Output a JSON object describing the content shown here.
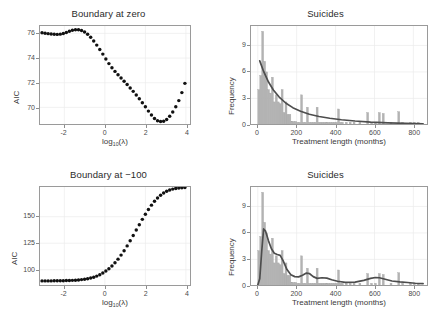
{
  "figure": {
    "kind": "2x2 panel figure",
    "background": "#ffffff",
    "colors": {
      "point": "#111111",
      "bar_fill": "#b3b3b3",
      "bar_stroke": "#a6a6a6",
      "curve": "#4d4d4d",
      "axis": "#9a9a9a",
      "grid": "#ebebeb",
      "text": "#3a3a3a"
    }
  },
  "panels": {
    "top_left": {
      "title": "Boundary at zero",
      "xlabel_main": "log",
      "xlabel_sub": "10",
      "xlabel_tail": "(λ)",
      "ylabel": "AIC"
    },
    "top_right": {
      "title": "Suicides",
      "xlabel": "Treatment length (months)",
      "ylabel": "Frequency"
    },
    "bottom_left": {
      "title": "Boundary at −100",
      "xlabel_main": "log",
      "xlabel_sub": "10",
      "xlabel_tail": "(λ)",
      "ylabel": "AIC"
    },
    "bottom_right": {
      "title": "Suicides",
      "xlabel": "Treatment length (months)",
      "ylabel": "Frequency"
    }
  },
  "chart_data": [
    {
      "id": "top_left",
      "type": "scatter",
      "title": "Boundary at zero",
      "xlabel": "log10(lambda)",
      "ylabel": "AIC",
      "xlim": [
        -3.2,
        4.2
      ],
      "ylim": [
        68.6,
        76.6
      ],
      "xticks": [
        -2,
        0,
        2,
        4
      ],
      "xticklabels": [
        "-2",
        "0",
        "2",
        "4"
      ],
      "yticks": [
        70,
        72,
        74,
        76
      ],
      "yticklabels": [
        "70",
        "72",
        "74",
        "76"
      ],
      "grid": true,
      "legend": "none",
      "x": [
        -3.1,
        -2.95,
        -2.8,
        -2.65,
        -2.5,
        -2.35,
        -2.2,
        -2.05,
        -1.9,
        -1.75,
        -1.6,
        -1.45,
        -1.3,
        -1.15,
        -1.0,
        -0.85,
        -0.7,
        -0.55,
        -0.4,
        -0.25,
        -0.1,
        0.05,
        0.2,
        0.35,
        0.5,
        0.65,
        0.8,
        0.95,
        1.1,
        1.25,
        1.4,
        1.55,
        1.7,
        1.85,
        2.0,
        2.15,
        2.3,
        2.45,
        2.6,
        2.75,
        2.9,
        3.05,
        3.2,
        3.35,
        3.5,
        3.65,
        3.8,
        3.95
      ],
      "y": [
        76.05,
        76.02,
        75.98,
        75.95,
        75.93,
        75.92,
        75.94,
        75.99,
        76.08,
        76.18,
        76.26,
        76.3,
        76.3,
        76.24,
        76.12,
        75.93,
        75.68,
        75.38,
        75.05,
        74.7,
        74.32,
        73.92,
        73.55,
        73.22,
        72.92,
        72.64,
        72.38,
        72.12,
        71.85,
        71.58,
        71.3,
        71.0,
        70.7,
        70.38,
        70.05,
        69.7,
        69.38,
        69.1,
        68.92,
        68.85,
        68.88,
        69.02,
        69.28,
        69.62,
        70.05,
        70.55,
        71.2,
        71.95
      ]
    },
    {
      "id": "top_right",
      "type": "bar",
      "title": "Suicides",
      "xlabel": "Treatment length (months)",
      "ylabel": "Frequency",
      "xlim": [
        -35,
        870
      ],
      "ylim": [
        0,
        11.2
      ],
      "xticks": [
        0,
        200,
        400,
        600,
        800
      ],
      "xticklabels": [
        "0",
        "200",
        "400",
        "600",
        "800"
      ],
      "yticks": [
        0,
        3,
        6,
        9
      ],
      "yticklabels": [
        "0",
        "3",
        "6",
        "9"
      ],
      "grid": true,
      "legend": "none",
      "bin_width": 10,
      "bin_centers": [
        5,
        15,
        25,
        35,
        45,
        55,
        65,
        75,
        85,
        95,
        105,
        115,
        125,
        135,
        145,
        155,
        165,
        175,
        185,
        195,
        205,
        215,
        225,
        235,
        245,
        255,
        265,
        275,
        285,
        295,
        305,
        315,
        325,
        335,
        345,
        355,
        365,
        375,
        385,
        395,
        405,
        415,
        425,
        435,
        455,
        475,
        495,
        525,
        565,
        585,
        605,
        625,
        645,
        685,
        725,
        745,
        785,
        805,
        825
      ],
      "values": [
        4.0,
        5.6,
        10.6,
        7.2,
        6.0,
        4.0,
        3.6,
        5.4,
        2.6,
        3.4,
        2.6,
        2.4,
        4.0,
        1.4,
        2.6,
        1.2,
        1.2,
        0.4,
        0.4,
        0.4,
        0.3,
        0.3,
        3.4,
        0.3,
        0.3,
        2.0,
        0.3,
        0.3,
        0.3,
        0.3,
        2.0,
        0.3,
        0.3,
        0.3,
        0.3,
        0.3,
        0.3,
        0.3,
        0.3,
        0.3,
        0.3,
        1.8,
        0.3,
        0.3,
        0.3,
        0.3,
        0.3,
        0.3,
        1.4,
        0.3,
        0.3,
        1.4,
        1.3,
        0.3,
        1.5,
        0.3,
        0.3,
        0.3,
        0.3
      ],
      "overlay_curve": {
        "name": "fitted density (monotone decreasing)",
        "x": [
          10,
          30,
          55,
          80,
          110,
          145,
          180,
          220,
          265,
          315,
          370,
          430,
          500,
          580,
          670,
          760,
          850
        ],
        "y": [
          7.25,
          6.05,
          4.85,
          3.95,
          3.15,
          2.45,
          1.95,
          1.55,
          1.2,
          0.95,
          0.75,
          0.58,
          0.44,
          0.32,
          0.23,
          0.17,
          0.12
        ]
      }
    },
    {
      "id": "bottom_left",
      "type": "scatter",
      "title": "Boundary at -100",
      "xlabel": "log10(lambda)",
      "ylabel": "AIC",
      "xlim": [
        -3.2,
        4.2
      ],
      "ylim": [
        85,
        178
      ],
      "xticks": [
        -2,
        0,
        2,
        4
      ],
      "xticklabels": [
        "-2",
        "0",
        "2",
        "4"
      ],
      "yticks": [
        100,
        125,
        150
      ],
      "yticklabels": [
        "100",
        "125",
        "150"
      ],
      "grid": true,
      "legend": "none",
      "x": [
        -3.1,
        -2.95,
        -2.8,
        -2.65,
        -2.5,
        -2.35,
        -2.2,
        -2.05,
        -1.9,
        -1.75,
        -1.6,
        -1.45,
        -1.3,
        -1.15,
        -1.0,
        -0.85,
        -0.7,
        -0.55,
        -0.4,
        -0.25,
        -0.1,
        0.05,
        0.2,
        0.35,
        0.5,
        0.65,
        0.8,
        0.95,
        1.1,
        1.25,
        1.4,
        1.55,
        1.7,
        1.85,
        2.0,
        2.15,
        2.3,
        2.45,
        2.6,
        2.75,
        2.9,
        3.05,
        3.2,
        3.35,
        3.5,
        3.65,
        3.8,
        3.95
      ],
      "y": [
        89.5,
        89.5,
        89.5,
        89.5,
        89.6,
        89.6,
        89.6,
        89.7,
        89.8,
        89.9,
        90.0,
        90.2,
        90.4,
        90.7,
        91.1,
        91.6,
        92.2,
        93.0,
        94.0,
        95.3,
        96.9,
        98.8,
        101.0,
        103.6,
        106.6,
        110.0,
        113.8,
        118.0,
        122.5,
        127.3,
        132.3,
        137.4,
        142.5,
        147.5,
        152.3,
        156.8,
        160.9,
        164.5,
        167.6,
        170.2,
        172.3,
        173.9,
        175.1,
        176.0,
        176.6,
        177.0,
        177.3,
        177.5
      ]
    },
    {
      "id": "bottom_right",
      "type": "bar",
      "title": "Suicides",
      "xlabel": "Treatment length (months)",
      "ylabel": "Frequency",
      "xlim": [
        -35,
        870
      ],
      "ylim": [
        0,
        11.2
      ],
      "xticks": [
        0,
        200,
        400,
        600,
        800
      ],
      "xticklabels": [
        "0",
        "200",
        "400",
        "600",
        "800"
      ],
      "yticks": [
        0,
        3,
        6,
        9
      ],
      "yticklabels": [
        "0",
        "3",
        "6",
        "9"
      ],
      "grid": true,
      "legend": "none",
      "bin_width": 10,
      "bin_centers": [
        5,
        15,
        25,
        35,
        45,
        55,
        65,
        75,
        85,
        95,
        105,
        115,
        125,
        135,
        145,
        155,
        165,
        175,
        185,
        195,
        205,
        215,
        225,
        235,
        245,
        255,
        265,
        275,
        285,
        295,
        305,
        315,
        325,
        335,
        345,
        355,
        365,
        375,
        385,
        395,
        405,
        415,
        425,
        435,
        455,
        475,
        495,
        525,
        565,
        585,
        605,
        625,
        645,
        685,
        725,
        745,
        785,
        805,
        825
      ],
      "values": [
        4.0,
        5.6,
        10.6,
        7.2,
        6.0,
        4.0,
        3.6,
        5.4,
        2.6,
        3.4,
        2.6,
        2.4,
        4.0,
        1.4,
        2.6,
        1.2,
        1.2,
        0.4,
        0.4,
        0.4,
        0.3,
        0.3,
        3.4,
        0.3,
        0.3,
        2.0,
        0.3,
        0.3,
        0.3,
        0.3,
        2.0,
        0.3,
        0.3,
        0.3,
        0.3,
        0.3,
        0.3,
        0.3,
        0.3,
        0.3,
        0.3,
        1.8,
        0.3,
        0.3,
        0.3,
        0.3,
        0.3,
        0.3,
        1.4,
        0.3,
        0.3,
        1.4,
        1.3,
        0.3,
        1.5,
        0.3,
        0.3,
        0.3,
        0.3
      ],
      "overlay_curve": {
        "name": "fitted density (multimodal)",
        "x": [
          0,
          10,
          20,
          30,
          40,
          55,
          70,
          85,
          100,
          115,
          130,
          150,
          170,
          190,
          210,
          230,
          250,
          265,
          285,
          305,
          330,
          355,
          380,
          410,
          450,
          500,
          545,
          580,
          605,
          625,
          650,
          690,
          730,
          770,
          810,
          850
        ],
        "y": [
          0.1,
          0.8,
          3.9,
          6.45,
          6.2,
          5.1,
          4.2,
          3.7,
          3.55,
          3.45,
          2.85,
          1.85,
          1.25,
          1.05,
          1.02,
          1.2,
          1.45,
          1.4,
          1.05,
          0.85,
          0.92,
          0.88,
          0.7,
          0.52,
          0.4,
          0.42,
          0.62,
          0.85,
          0.95,
          0.92,
          0.78,
          0.55,
          0.45,
          0.38,
          0.3,
          0.25
        ]
      }
    }
  ]
}
